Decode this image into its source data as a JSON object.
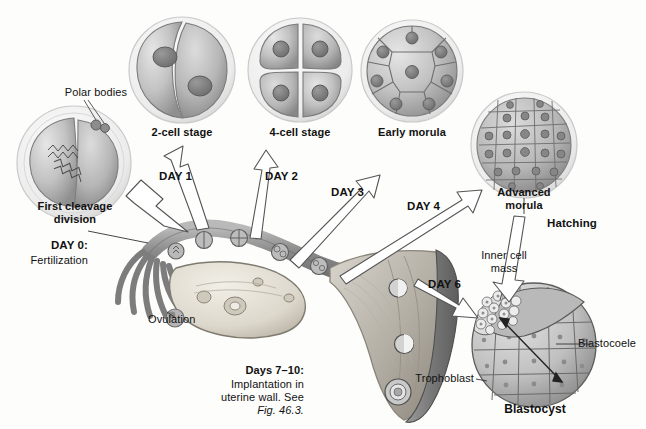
{
  "figure": {
    "background_color": "#fdfdfb",
    "ink_color": "#111111",
    "cell_fill_light": "#d8d8d8",
    "cell_fill_mid": "#b4b4b4",
    "cell_fill_dark": "#8e8e8e",
    "zona_color": "#ededed",
    "tissue_dark": "#8a8a8a",
    "tissue_light": "#cfcfcf"
  },
  "stages": [
    {
      "id": "first-cleavage",
      "label": "First cleavage\ndivision",
      "label_line1": "First cleavage",
      "label_line2": "division",
      "cells": 2,
      "note": "two blastomeres with spindle figures inside zona pellucida"
    },
    {
      "id": "two-cell",
      "label": "2-cell stage",
      "cells": 2,
      "note": "two blastomeres each with a nucleus"
    },
    {
      "id": "four-cell",
      "label": "4-cell stage",
      "cells": 4,
      "note": "four blastomeres each with a nucleus"
    },
    {
      "id": "early-morula",
      "label": "Early morula",
      "cells": 9,
      "note": "about nine visible blastomeres"
    },
    {
      "id": "advanced-morula",
      "label": "Advanced\nmorula",
      "label_line1": "Advanced",
      "label_line2": "morula",
      "cells": 24,
      "note": "many small compacted cells"
    },
    {
      "id": "blastocyst",
      "label": "Blastocyst",
      "note": "hollow sphere with inner cell mass, blastocoele and trophoblast"
    }
  ],
  "day_markers": [
    {
      "id": "day-0",
      "label": "DAY 0:",
      "sublabel": "Fertilization"
    },
    {
      "id": "day-1",
      "label": "DAY 1"
    },
    {
      "id": "day-2",
      "label": "DAY 2"
    },
    {
      "id": "day-3",
      "label": "DAY 3"
    },
    {
      "id": "day-4",
      "label": "DAY 4"
    },
    {
      "id": "day-6",
      "label": "DAY 6"
    }
  ],
  "callouts": {
    "polar_bodies": "Polar bodies",
    "ovulation": "Ovulation",
    "hatching": "Hatching",
    "inner_cell_mass_line1": "Inner cell",
    "inner_cell_mass_line2": "mass",
    "blastocoele": "Blastocoele",
    "trophoblast": "Trophoblast"
  },
  "implantation_note": {
    "heading": "Days 7–10:",
    "line1": "Implantation in",
    "line2": "uterine wall. See",
    "line3": "Fig. 46.3."
  }
}
